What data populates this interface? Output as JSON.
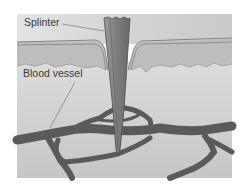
{
  "figure": {
    "labels": {
      "splinter": "Splinter",
      "blood_vessel": "Blood vessel"
    },
    "colors": {
      "background": "#ffffff",
      "top_band": "#d2d2d2",
      "epidermis": "#c0c0c0",
      "dermis": "#cfcfcf",
      "skin_line": "#6e6e6e",
      "splinter_fill": "#8a8a8a",
      "splinter_edge": "#4e4e4e",
      "vessel": "#5a5a5a",
      "leader_line": "#6a6a6a"
    }
  }
}
